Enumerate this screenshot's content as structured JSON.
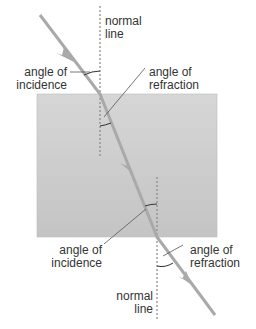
{
  "diagram": {
    "labels": {
      "normal_top_1": "normal",
      "normal_top_2": "line",
      "incidence_top_1": "angle of",
      "incidence_top_2": "incidence",
      "refraction_top_1": "angle of",
      "refraction_top_2": "refraction",
      "incidence_bottom_1": "angle of",
      "incidence_bottom_2": "incidence",
      "refraction_bottom_1": "angle of",
      "refraction_bottom_2": "refraction",
      "normal_bottom_1": "normal",
      "normal_bottom_2": "line"
    },
    "colors": {
      "ray": "#a9a9a9",
      "block_top": "#c8c8c8",
      "block_bottom": "#d8d8d8",
      "normal": "#888888",
      "text": "#333333"
    }
  }
}
